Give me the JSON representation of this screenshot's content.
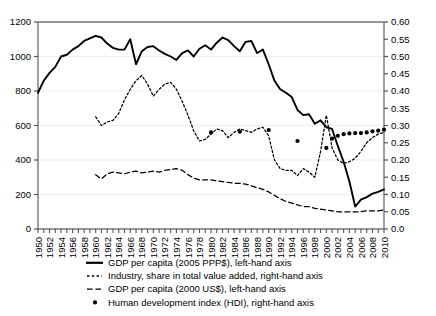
{
  "chart_data": {
    "type": "line",
    "title": "",
    "xlabel": "",
    "ylabel": "",
    "grid": true,
    "legend_position": "bottom",
    "x_axis": {
      "min": 1950,
      "max": 2010,
      "tick_step": 2,
      "tick_labels": [
        "1950",
        "1952",
        "1954",
        "1956",
        "1958",
        "1960",
        "1962",
        "1964",
        "1966",
        "1968",
        "1970",
        "1972",
        "1974",
        "1976",
        "1978",
        "1980",
        "1982",
        "1984",
        "1986",
        "1988",
        "1990",
        "1992",
        "1994",
        "1996",
        "1998",
        "2000",
        "2002",
        "2004",
        "2006",
        "2008",
        "2010"
      ],
      "minor_ticks_every": 1
    },
    "y_axis_left": {
      "label": "",
      "min": 0,
      "max": 1200,
      "tick_step": 200,
      "tick_labels": [
        "0",
        "200",
        "400",
        "600",
        "800",
        "1000",
        "1200"
      ]
    },
    "y_axis_right": {
      "label": "",
      "min": 0.0,
      "max": 0.6,
      "tick_step": 0.05,
      "tick_labels": [
        "0.0",
        "0.05",
        "0.10",
        "0.15",
        "0.20",
        "0.25",
        "0.30",
        "0.35",
        "0.40",
        "0.45",
        "0.50",
        "0.55",
        "0.60"
      ]
    },
    "series": [
      {
        "name": "GDP per capita (2005 PPP$), left-hand axis",
        "key": "gdp_ppp",
        "axis": "left",
        "style": "solid",
        "color": "#000000",
        "x": [
          1950,
          1951,
          1952,
          1953,
          1954,
          1955,
          1956,
          1957,
          1958,
          1959,
          1960,
          1961,
          1962,
          1963,
          1964,
          1965,
          1966,
          1967,
          1968,
          1969,
          1970,
          1971,
          1972,
          1973,
          1974,
          1975,
          1976,
          1977,
          1978,
          1979,
          1980,
          1981,
          1982,
          1983,
          1984,
          1985,
          1986,
          1987,
          1988,
          1989,
          1990,
          1991,
          1992,
          1993,
          1994,
          1995,
          1996,
          1997,
          1998,
          1999,
          2000,
          2001,
          2002,
          2003,
          2004,
          2005,
          2006,
          2007,
          2008,
          2009,
          2010
        ],
        "y": [
          790,
          860,
          905,
          940,
          1000,
          1010,
          1040,
          1060,
          1090,
          1105,
          1120,
          1110,
          1075,
          1050,
          1040,
          1040,
          1100,
          955,
          1030,
          1055,
          1060,
          1035,
          1015,
          1000,
          980,
          1020,
          1035,
          1000,
          1045,
          1065,
          1040,
          1080,
          1110,
          1095,
          1060,
          1030,
          1085,
          1090,
          1020,
          1040,
          955,
          860,
          810,
          790,
          765,
          690,
          660,
          665,
          610,
          630,
          590,
          580,
          480,
          390,
          275,
          130,
          170,
          185,
          205,
          215,
          230
        ]
      },
      {
        "name": "Industry, share in total value added, right-hand axis",
        "key": "industry_share",
        "axis": "right",
        "style": "dotted",
        "color": "#000000",
        "x": [
          1960,
          1961,
          1962,
          1963,
          1964,
          1965,
          1966,
          1967,
          1968,
          1969,
          1970,
          1971,
          1972,
          1973,
          1974,
          1975,
          1976,
          1977,
          1978,
          1979,
          1980,
          1981,
          1982,
          1983,
          1984,
          1985,
          1986,
          1987,
          1988,
          1989,
          1990,
          1991,
          1992,
          1993,
          1994,
          1995,
          1996,
          1997,
          1998,
          1999,
          2000,
          2001,
          2002,
          2003,
          2004,
          2005,
          2006,
          2007,
          2008,
          2009,
          2010
        ],
        "y": [
          0.325,
          0.3,
          0.31,
          0.315,
          0.335,
          0.375,
          0.405,
          0.43,
          0.445,
          0.42,
          0.385,
          0.405,
          0.42,
          0.425,
          0.405,
          0.37,
          0.33,
          0.285,
          0.255,
          0.26,
          0.275,
          0.29,
          0.285,
          0.265,
          0.28,
          0.29,
          0.285,
          0.28,
          0.29,
          0.295,
          0.27,
          0.2,
          0.175,
          0.17,
          0.17,
          0.155,
          0.175,
          0.165,
          0.15,
          0.225,
          0.33,
          0.235,
          0.2,
          0.19,
          0.195,
          0.205,
          0.225,
          0.25,
          0.265,
          0.275,
          0.28
        ]
      },
      {
        "name": "GDP per capita (2000 US$), left-hand axis",
        "key": "gdp_usd",
        "axis": "left",
        "style": "dashed",
        "color": "#000000",
        "x": [
          1960,
          1961,
          1962,
          1963,
          1964,
          1965,
          1966,
          1967,
          1968,
          1969,
          1970,
          1971,
          1972,
          1973,
          1974,
          1975,
          1976,
          1977,
          1978,
          1979,
          1980,
          1981,
          1982,
          1983,
          1984,
          1985,
          1986,
          1987,
          1988,
          1989,
          1990,
          1991,
          1992,
          1993,
          1994,
          1995,
          1996,
          1997,
          1998,
          1999,
          2000,
          2001,
          2002,
          2003,
          2004,
          2005,
          2006,
          2007,
          2008,
          2009,
          2010
        ],
        "y": [
          315,
          290,
          320,
          330,
          325,
          320,
          330,
          335,
          325,
          330,
          335,
          330,
          340,
          345,
          350,
          340,
          315,
          295,
          285,
          285,
          285,
          280,
          275,
          270,
          265,
          265,
          260,
          250,
          240,
          230,
          215,
          195,
          175,
          160,
          150,
          140,
          130,
          130,
          120,
          115,
          110,
          105,
          100,
          100,
          100,
          100,
          100,
          105,
          105,
          105,
          110
        ]
      },
      {
        "name": "Human development index (HDI), right-hand axis",
        "key": "hdi",
        "axis": "right",
        "style": "markers",
        "color": "#000000",
        "x": [
          1980,
          1985,
          1990,
          1995,
          2000,
          2001,
          2002,
          2003,
          2004,
          2005,
          2006,
          2007,
          2008,
          2009,
          2010
        ],
        "y": [
          0.28,
          0.282,
          0.287,
          0.255,
          0.235,
          0.262,
          0.27,
          0.275,
          0.277,
          0.278,
          0.278,
          0.28,
          0.283,
          0.285,
          0.288
        ]
      }
    ]
  },
  "legend": {
    "items": [
      {
        "label": "GDP per capita (2005 PPP$), left-hand axis",
        "marker": "solid-line"
      },
      {
        "label": "Industry, share in total value added, right-hand axis",
        "marker": "dotted-line"
      },
      {
        "label": "GDP per capita (2000 US$), left-hand axis",
        "marker": "dashed-line"
      },
      {
        "label": "Human development index (HDI), right-hand axis",
        "marker": "dot-marker"
      }
    ]
  }
}
